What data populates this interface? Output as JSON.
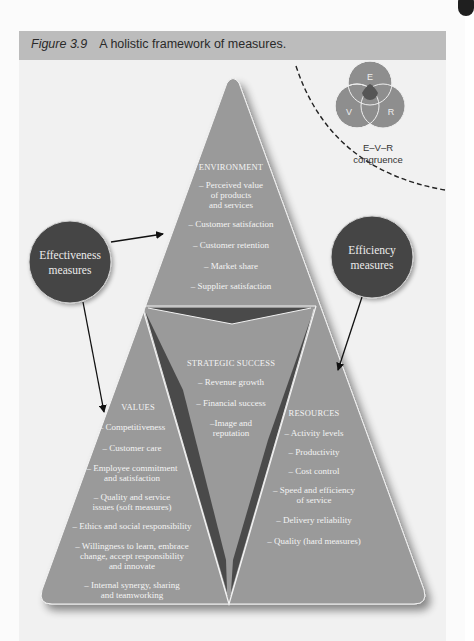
{
  "caption": {
    "figure_number": "Figure 3.9",
    "title": "A holistic framework of measures."
  },
  "venn": {
    "letters": [
      "E",
      "V",
      "R"
    ],
    "caption_line1": "E–V–R",
    "caption_line2": "congruence"
  },
  "circles": {
    "effectiveness": {
      "line1": "Effectiveness",
      "line2": "measures"
    },
    "efficiency": {
      "line1": "Efficiency",
      "line2": "measures"
    }
  },
  "environment": {
    "heading": "ENVIRONMENT",
    "items": [
      "– Perceived value",
      "of products",
      "and services",
      "– Customer satisfaction",
      "– Customer retention",
      "– Market share",
      "– Supplier satisfaction"
    ]
  },
  "strategic_success": {
    "heading": "STRATEGIC SUCCESS",
    "items": [
      "– Revenue growth",
      "– Financial success",
      "–Image and",
      "reputation"
    ]
  },
  "values": {
    "heading": "VALUES",
    "items": [
      "– Competitiveness",
      "– Customer care",
      "– Employee commitment",
      "and satisfaction",
      "– Quality and service",
      "issues (soft measures)",
      "– Ethics and social responsibility",
      "– Willingness to learn, embrace",
      "change, accept responsibility",
      "and innovate",
      "– Internal synergy, sharing",
      "and teamworking"
    ]
  },
  "resources": {
    "heading": "RESOURCES",
    "items": [
      "– Activity levels",
      "– Productivity",
      "– Cost control",
      "– Speed and efficiency",
      "of service",
      "– Delivery reliability",
      "– Quality (hard measures)"
    ]
  },
  "colors": {
    "caption_bar": "#bcbcbc",
    "pyramid_fill": "#9a9a9a",
    "dark_wedge": "#4a4a4a",
    "circle_fill": "#454545",
    "venn_fill": "#8e8e8e",
    "venn_center": "#555555",
    "label_text": "#f4f4f4"
  }
}
